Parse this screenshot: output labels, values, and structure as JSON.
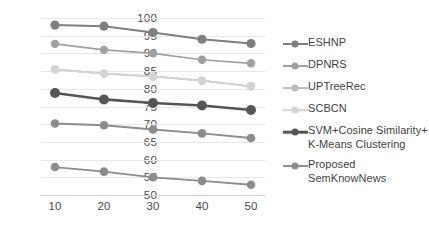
{
  "chart_data": {
    "type": "line",
    "title": "",
    "xlabel": "",
    "ylabel": "",
    "x": [
      10,
      20,
      30,
      40,
      50
    ],
    "xticklabels": [
      "10",
      "20",
      "30",
      "40",
      "50"
    ],
    "yticklabels": [
      "100",
      "95",
      "90",
      "85",
      "80",
      "75",
      "70",
      "65",
      "60",
      "55",
      "50"
    ],
    "yticks": [
      100,
      95,
      90,
      85,
      80,
      75,
      70,
      65,
      60,
      55,
      50
    ],
    "ylim": [
      50,
      100
    ],
    "xlim": [
      10,
      50
    ],
    "grid": true,
    "legend_position": "right",
    "series": [
      {
        "name": "ESHNP",
        "values": [
          98.0,
          97.7,
          95.9,
          94.0,
          92.8
        ],
        "color": "#7f7f7f",
        "width": 2.0,
        "marker_size": 4.6
      },
      {
        "name": "DPNRS",
        "values": [
          92.7,
          91.0,
          90.0,
          88.2,
          87.2
        ],
        "color": "#a0a0a0",
        "width": 1.7,
        "marker_size": 4.2
      },
      {
        "name": "UPTreeRec",
        "values": [
          85.5,
          84.3,
          83.5,
          82.3,
          80.7
        ],
        "color": "#bcbcbc",
        "width": 1.7,
        "marker_size": 4.2
      },
      {
        "name": "SCBCN",
        "values": [
          85.5,
          84.3,
          83.5,
          82.3,
          80.7
        ],
        "color": "#d4d4d4",
        "width": 1.7,
        "marker_size": 4.2
      },
      {
        "name": "SVM+Cosine Similarity+ K-Means Clustering",
        "values": [
          78.8,
          77.0,
          76.0,
          75.3,
          74.0
        ],
        "color": "#555555",
        "width": 2.6,
        "marker_size": 5.0
      },
      {
        "name": "Proposed SemKnowNews",
        "values": [
          70.2,
          69.7,
          68.5,
          67.4,
          66.1
        ],
        "color": "#8c8c8c",
        "width": 1.8,
        "marker_size": 4.3
      },
      {
        "name": "SemKnowNews-lower",
        "values": [
          57.9,
          56.6,
          55.0,
          54.0,
          52.9
        ],
        "color": "#8c8c8c",
        "width": 1.8,
        "marker_size": 4.3
      }
    ],
    "legend": [
      {
        "label": "ESHNP",
        "color": "#7f7f7f",
        "width": 2.0
      },
      {
        "label": "DPNRS",
        "color": "#a0a0a0",
        "width": 1.9
      },
      {
        "label": "UPTreeRec",
        "color": "#bcbcbc",
        "width": 1.8
      },
      {
        "label": "SCBCN",
        "color": "#d4d4d4",
        "width": 1.8
      },
      {
        "label": "SVM+Cosine Similarity+ K-Means Clustering",
        "color": "#555555",
        "width": 2.6
      },
      {
        "label": "Proposed SemKnowNews",
        "color": "#8c8c8c",
        "width": 1.9
      }
    ],
    "colors": {
      "grid": "#e8e8e8",
      "tick_text": "#4a4a4a",
      "legend_text": "#3f3f3f",
      "background": "#ffffff"
    }
  }
}
